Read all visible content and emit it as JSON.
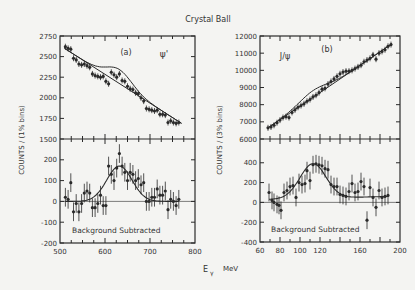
{
  "title": "Crystal Ball",
  "xlabel": "Eγ  MeV",
  "xlabel_main": "E",
  "xlabel_sub": "γ",
  "xlabel_unit": "MeV",
  "colors": {
    "background": "#f4f4f2",
    "ink": "#2a2a2a"
  },
  "chart_data": [
    {
      "type": "scatter",
      "panel": "(a)",
      "label": "ψ'",
      "subplot": "top",
      "ylabel": "COUNTS / (1% bins)",
      "xlim": [
        500,
        800
      ],
      "ylim": [
        1500,
        2750
      ],
      "yticks": [
        1500,
        1750,
        2000,
        2250,
        2500,
        2750
      ],
      "xticks": [
        500,
        600,
        700,
        800
      ],
      "data": {
        "x": [
          512,
          518,
          524,
          530,
          536,
          542,
          548,
          554,
          560,
          566,
          572,
          578,
          584,
          590,
          596,
          602,
          608,
          614,
          620,
          626,
          632,
          638,
          644,
          650,
          656,
          662,
          668,
          674,
          680,
          686,
          692,
          698,
          704,
          710,
          716,
          722,
          728,
          734,
          740,
          746,
          752,
          758,
          764
        ],
        "y": [
          2620,
          2600,
          2590,
          2480,
          2460,
          2410,
          2400,
          2410,
          2390,
          2370,
          2290,
          2270,
          2260,
          2250,
          2260,
          2200,
          2170,
          2310,
          2280,
          2250,
          2290,
          2210,
          2200,
          2140,
          2110,
          2100,
          2060,
          2050,
          2000,
          1960,
          1870,
          1860,
          1850,
          1840,
          1850,
          1800,
          1800,
          1790,
          1700,
          1720,
          1700,
          1690,
          1700
        ]
      },
      "background_fit": {
        "x": [
          510,
          770
        ],
        "y": [
          2600,
          1690
        ]
      },
      "signal_fit_peak": {
        "center": 632,
        "amplitude": 170,
        "sigma": 28
      }
    },
    {
      "type": "scatter",
      "panel": "(a)",
      "subplot": "bottom",
      "annotation": "Background Subtracted",
      "xlim": [
        500,
        800
      ],
      "ylim": [
        -200,
        300
      ],
      "yticks": [
        -200,
        -100,
        0,
        100,
        200
      ],
      "xticks": [
        500,
        600,
        700,
        800
      ],
      "data": {
        "x": [
          512,
          518,
          524,
          530,
          536,
          542,
          548,
          554,
          560,
          566,
          572,
          578,
          584,
          590,
          596,
          602,
          608,
          614,
          620,
          626,
          632,
          638,
          644,
          650,
          656,
          662,
          668,
          674,
          680,
          686,
          692,
          698,
          704,
          710,
          716,
          722,
          728,
          734,
          740,
          746,
          752,
          758,
          764
        ],
        "y": [
          20,
          10,
          90,
          -50,
          -10,
          -50,
          -10,
          40,
          50,
          40,
          -30,
          -30,
          -10,
          30,
          -20,
          -20,
          170,
          130,
          100,
          160,
          230,
          170,
          140,
          100,
          140,
          130,
          100,
          110,
          80,
          90,
          0,
          0,
          20,
          20,
          60,
          30,
          30,
          50,
          -40,
          10,
          0,
          -20,
          10
        ]
      },
      "fit": {
        "type": "gaussian",
        "center": 632,
        "amplitude": 170,
        "sigma": 28,
        "baseline": 0
      }
    },
    {
      "type": "scatter",
      "panel": "(b)",
      "label": "J/ψ",
      "subplot": "top",
      "ylabel": "COUNTS / (3% bins)",
      "xlim": [
        60,
        200
      ],
      "ylim": [
        6000,
        12000
      ],
      "yticks": [
        6000,
        7000,
        8000,
        9000,
        10000,
        11000,
        12000
      ],
      "xticks": [
        60,
        80,
        100,
        120,
        160,
        200
      ],
      "data": {
        "x": [
          68,
          71,
          74,
          77,
          80,
          83,
          86,
          89,
          92,
          95,
          98,
          101,
          104,
          107,
          110,
          113,
          116,
          119,
          122,
          125,
          128,
          131,
          134,
          137,
          140,
          143,
          146,
          149,
          152,
          155,
          158,
          161,
          164,
          167,
          170,
          173,
          176,
          179,
          182,
          185,
          188,
          191
        ],
        "y": [
          6650,
          6700,
          6800,
          6950,
          7100,
          7250,
          7300,
          7250,
          7550,
          7700,
          7850,
          7950,
          8050,
          8200,
          8300,
          8450,
          8550,
          8700,
          8900,
          8950,
          9200,
          9350,
          9500,
          9650,
          9800,
          9900,
          9950,
          9950,
          10000,
          10100,
          10200,
          10300,
          10500,
          10600,
          10700,
          10900,
          10650,
          11000,
          11100,
          11200,
          11400,
          11500
        ]
      },
      "background_fit": {
        "x": [
          68,
          192
        ],
        "y": [
          6650,
          11550
        ]
      },
      "signal_fit_peak": {
        "center": 113,
        "amplitude": 390,
        "sigma": 14
      }
    },
    {
      "type": "scatter",
      "panel": "(b)",
      "subplot": "bottom",
      "annotation": "Background Subtracted",
      "xlim": [
        60,
        200
      ],
      "ylim": [
        -400,
        640
      ],
      "yticks": [
        -400,
        -200,
        0,
        200,
        400
      ],
      "xticks": [
        60,
        80,
        100,
        120,
        160,
        200
      ],
      "data": {
        "x": [
          69,
          72,
          74,
          77,
          79,
          81,
          84,
          87,
          90,
          93,
          96,
          99,
          102,
          105,
          107,
          110,
          113,
          116,
          119,
          122,
          125,
          128,
          131,
          134,
          137,
          140,
          143,
          146,
          149,
          152,
          155,
          158,
          161,
          164,
          167,
          170,
          173,
          176,
          179,
          182,
          185,
          188
        ],
        "y": [
          100,
          20,
          0,
          -20,
          -30,
          -80,
          100,
          120,
          160,
          170,
          50,
          200,
          180,
          190,
          320,
          220,
          380,
          390,
          380,
          370,
          340,
          330,
          180,
          160,
          160,
          80,
          70,
          60,
          110,
          190,
          100,
          110,
          210,
          160,
          -180,
          150,
          50,
          -50,
          120,
          50,
          60,
          70
        ]
      },
      "fit": {
        "type": "gaussian",
        "center": 113,
        "amplitude": 350,
        "sigma": 13,
        "baseline_slope": [
          30,
          60
        ]
      }
    }
  ]
}
